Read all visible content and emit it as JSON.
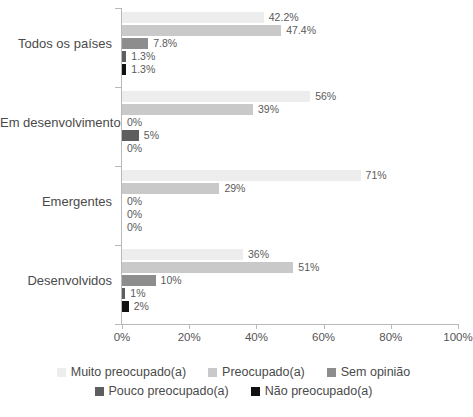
{
  "chart_data": {
    "type": "bar",
    "orientation": "horizontal",
    "title": "",
    "xlabel": "",
    "ylabel": "",
    "xlim": [
      0,
      100
    ],
    "xticks": [
      "0%",
      "20%",
      "40%",
      "60%",
      "80%",
      "100%"
    ],
    "xtick_values": [
      0,
      20,
      40,
      60,
      80,
      100
    ],
    "grid": false,
    "legend_position": "bottom",
    "categories": [
      "Todos os países",
      "Em desenvolvimento",
      "Emergentes",
      "Desenvolvidos"
    ],
    "series": [
      {
        "name": "Muito preocupado(a)",
        "color": "#ededed",
        "values": [
          42.2,
          56,
          71,
          36
        ],
        "labels": [
          "42.2%",
          "56%",
          "71%",
          "36%"
        ]
      },
      {
        "name": "Preocupado(a)",
        "color": "#c9c9c9",
        "values": [
          47.4,
          39,
          29,
          51
        ],
        "labels": [
          "47.4%",
          "39%",
          "29%",
          "51%"
        ]
      },
      {
        "name": "Sem opinião",
        "color": "#8d8d8d",
        "values": [
          7.8,
          0,
          0,
          10
        ],
        "labels": [
          "7.8%",
          "0%",
          "0%",
          "10%"
        ]
      },
      {
        "name": "Pouco preocupado(a)",
        "color": "#5e5e5e",
        "values": [
          1.3,
          5,
          0,
          1
        ],
        "labels": [
          "1.3%",
          "5%",
          "0%",
          "1%"
        ]
      },
      {
        "name": "Não preocupado(a)",
        "color": "#111111",
        "values": [
          1.3,
          0,
          0,
          2
        ],
        "labels": [
          "1.3%",
          "0%",
          "0%",
          "2%"
        ]
      }
    ]
  },
  "legend": {
    "items": [
      {
        "label": "Muito preocupado(a)",
        "color": "#ededed"
      },
      {
        "label": "Preocupado(a)",
        "color": "#c9c9c9"
      },
      {
        "label": "Sem opinião",
        "color": "#8d8d8d"
      },
      {
        "label": "Pouco preocupado(a)",
        "color": "#5e5e5e"
      },
      {
        "label": "Não preocupado(a)",
        "color": "#111111"
      }
    ]
  }
}
